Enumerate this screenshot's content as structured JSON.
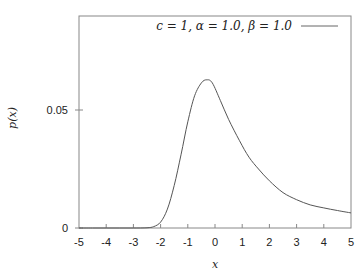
{
  "chart_data": {
    "type": "line",
    "title": "",
    "xlabel": "x",
    "ylabel": "p(x)",
    "xlim": [
      -5,
      5
    ],
    "ylim": [
      0,
      0.09
    ],
    "grid": false,
    "legend_position": "top-right",
    "x_ticks": [
      -5,
      -4,
      -3,
      -2,
      -1,
      0,
      1,
      2,
      3,
      4,
      5
    ],
    "x_tick_labels": [
      "-5",
      "-4",
      "-3",
      "-2",
      "-1",
      "0",
      "1",
      "2",
      "3",
      "4",
      "5"
    ],
    "y_ticks": [
      0,
      0.05
    ],
    "y_tick_labels": [
      "0",
      "0.05"
    ],
    "series": [
      {
        "name": "c = 1, α = 1.0, β = 1.0",
        "color": "#555555",
        "x": [
          -5,
          -4.5,
          -4,
          -3.5,
          -3,
          -2.5,
          -2.25,
          -2,
          -1.75,
          -1.5,
          -1.25,
          -1,
          -0.75,
          -0.5,
          -0.3,
          -0.1,
          0.2,
          0.5,
          0.9,
          1.25,
          1.6,
          2.0,
          2.5,
          3.0,
          3.5,
          4.0,
          4.5,
          5.0
        ],
        "values": [
          0,
          0,
          0,
          0,
          0,
          0.0001,
          0.0006,
          0.0025,
          0.008,
          0.018,
          0.031,
          0.045,
          0.056,
          0.0615,
          0.0628,
          0.0615,
          0.054,
          0.046,
          0.037,
          0.03,
          0.025,
          0.02,
          0.015,
          0.012,
          0.0098,
          0.0085,
          0.0074,
          0.0064
        ]
      }
    ]
  },
  "legend": {
    "entry_label": "c = 1, α = 1.0, β = 1.0"
  }
}
